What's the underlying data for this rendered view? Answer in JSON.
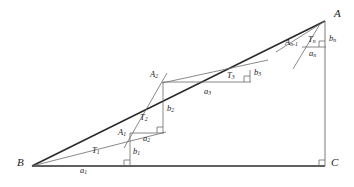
{
  "figure": {
    "stroke_color": "#4d4d4d",
    "stroke_color_bold": "#262626",
    "background": "#ffffff"
  },
  "vertices": {
    "A": {
      "label": "A",
      "sub": "",
      "x": 325,
      "y": 21,
      "label_x": 334,
      "label_y": 11
    },
    "B": {
      "label": "B",
      "sub": "",
      "x": 32,
      "y": 166,
      "label_x": 19,
      "label_y": 159
    },
    "C": {
      "label": "C",
      "sub": "",
      "x": 325,
      "y": 166,
      "label_x": 332,
      "label_y": 159
    },
    "A1": {
      "label": "A",
      "sub": "1",
      "x": 130,
      "y": 139,
      "label_x": 118,
      "label_y": 131
    },
    "A2": {
      "label": "A",
      "sub": "2",
      "x": 163,
      "y": 82,
      "label_x": 151,
      "label_y": 72
    },
    "An1": {
      "label": "A",
      "sub": "n-1",
      "x": 304,
      "y": 41,
      "label_x": 287,
      "label_y": 38
    }
  },
  "triangle_labels": {
    "T1": {
      "label": "T",
      "sub": "1",
      "x": 95,
      "y": 147
    },
    "T2": {
      "label": "T",
      "sub": "2",
      "x": 143,
      "y": 115
    },
    "T3": {
      "label": "T",
      "sub": "3",
      "x": 230,
      "y": 74
    },
    "Tn": {
      "label": "T",
      "sub": "n",
      "x": 311,
      "y": 37
    }
  },
  "side_labels": {
    "a1": {
      "label": "a",
      "sub": "1",
      "x": 83,
      "y": 166
    },
    "b1": {
      "label": "b",
      "sub": "1",
      "x": 135,
      "y": 148
    },
    "a2": {
      "label": "a",
      "sub": "2",
      "x": 146,
      "y": 137
    },
    "b2": {
      "label": "b",
      "sub": "2",
      "x": 169,
      "y": 107
    },
    "a3": {
      "label": "a",
      "sub": "3",
      "x": 207,
      "y": 91
    },
    "b3": {
      "label": "b",
      "sub": "3",
      "x": 256,
      "y": 72
    },
    "an": {
      "label": "a",
      "sub": "n",
      "x": 312,
      "y": 51
    },
    "bn": {
      "label": "b",
      "sub": "n",
      "x": 331,
      "y": 36
    }
  },
  "segments": {
    "base_BC": {
      "name": "base-bc",
      "x1": 32,
      "y1": 166,
      "x2": 325,
      "y2": 166,
      "weight": "bold"
    },
    "vertical_AC": {
      "name": "vertical-ac",
      "x1": 325,
      "y1": 21,
      "x2": 325,
      "y2": 166,
      "weight": "thin"
    },
    "hyp_BA": {
      "name": "hypotenuse-ba",
      "x1": 32,
      "y1": 166,
      "x2": 325,
      "y2": 21,
      "weight": "bold"
    },
    "ray_B_A1": {
      "name": "ray-b-a1",
      "x1": 32,
      "y1": 166,
      "x2": 163,
      "y2": 133,
      "weight": "thin"
    },
    "b1_vertical": {
      "name": "leg-b1",
      "x1": 130,
      "y1": 166,
      "x2": 130,
      "y2": 133,
      "weight": "thin"
    },
    "a2_horizontal": {
      "name": "leg-a2",
      "x1": 130,
      "y1": 133,
      "x2": 163,
      "y2": 133,
      "weight": "thin"
    },
    "b2_vertical": {
      "name": "leg-b2",
      "x1": 163,
      "y1": 133,
      "x2": 163,
      "y2": 82,
      "weight": "thin"
    },
    "ray_A1_up": {
      "name": "ray-a1-a2",
      "x1": 126,
      "y1": 146,
      "x2": 166,
      "y2": 75,
      "weight": "thin"
    },
    "a3_horizontal": {
      "name": "leg-a3",
      "x1": 163,
      "y1": 82,
      "x2": 250,
      "y2": 82,
      "weight": "thin"
    },
    "a3_top": {
      "name": "edge-a2-top",
      "x1": 163,
      "y1": 82,
      "x2": 250,
      "y2": 82,
      "weight": "thin"
    },
    "b3_vertical": {
      "name": "leg-b3",
      "x1": 250,
      "y1": 82,
      "x2": 250,
      "y2": 70,
      "weight": "thin"
    },
    "ray_A2_right": {
      "name": "ray-a2-a3",
      "x1": 163,
      "y1": 82,
      "x2": 266,
      "y2": 61,
      "weight": "thin"
    },
    "an_horizontal": {
      "name": "leg-an",
      "x1": 303,
      "y1": 47,
      "x2": 325,
      "y2": 47,
      "weight": "thin"
    },
    "bn_vertical": {
      "name": "leg-bn",
      "x1": 325,
      "y1": 47,
      "x2": 325,
      "y2": 21,
      "weight": "thin"
    },
    "ray_An1_A": {
      "name": "ray-an1-a",
      "x1": 278,
      "y1": 51,
      "x2": 325,
      "y2": 21,
      "weight": "thin"
    },
    "arc_An": {
      "name": "ray-an-through",
      "x1": 294,
      "y1": 68,
      "x2": 318,
      "y2": 25,
      "weight": "thin"
    }
  },
  "right_angles": [
    {
      "name": "right-angle-at-c",
      "x": 325,
      "y": 166,
      "dx": -1,
      "dy": -1
    },
    {
      "name": "right-angle-b1",
      "x": 130,
      "y": 166,
      "dx": -1,
      "dy": -1
    },
    {
      "name": "right-angle-a2b2",
      "x": 163,
      "y": 133,
      "dx": -1,
      "dy": -1
    },
    {
      "name": "right-angle-a3b3",
      "x": 250,
      "y": 82,
      "dx": -1,
      "dy": -1
    },
    {
      "name": "right-angle-anbn",
      "x": 325,
      "y": 47,
      "dx": -1,
      "dy": -1
    }
  ]
}
